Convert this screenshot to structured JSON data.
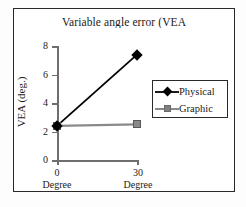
{
  "chart_data": {
    "type": "line",
    "title": "Variable angle error (VEA",
    "xlabel": "",
    "ylabel": "VEA (deg.)",
    "categories": [
      "0",
      "30"
    ],
    "category_units": [
      "Degree",
      "Degree"
    ],
    "series": [
      {
        "name": "Physical",
        "values": [
          2.4,
          7.4
        ],
        "color": "#000000",
        "marker": "diamond"
      },
      {
        "name": "Graphic",
        "values": [
          2.4,
          2.5
        ],
        "color": "#8a8a8a",
        "marker": "square"
      }
    ],
    "ylim": [
      0,
      8
    ],
    "yticks": [
      "0",
      "2",
      "4",
      "6",
      "8"
    ],
    "grid": false,
    "legend_position": "right"
  },
  "legend": {
    "entries": [
      {
        "label": "Physical",
        "marker": "diamond-marker",
        "color": "#000000"
      },
      {
        "label": "Graphic",
        "marker": "square-marker",
        "color": "#8a8a8a"
      }
    ]
  },
  "axes": {
    "y_tick_labels": [
      "8",
      "6",
      "4",
      "2",
      "0"
    ],
    "x_tick_labels": [
      "0",
      "30"
    ],
    "x_tick_units": [
      "Degree",
      "Degree"
    ],
    "axis_color": "#6e6e6e"
  },
  "frame": {
    "border_color": "#2a2a2a"
  }
}
